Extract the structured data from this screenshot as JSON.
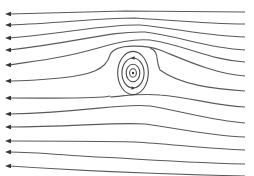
{
  "diagram": {
    "title": "Streamlines of uniform flow past a vortex",
    "colors": {
      "background": "#ffffff",
      "stroke": "#5a5a5a",
      "arrow": "#333333"
    },
    "flow_direction": "right-to-left",
    "vortex": {
      "cx": 133,
      "cy": 73,
      "rings": [
        4,
        8,
        13,
        18
      ],
      "rotation_marks": [
        "top",
        "bottom"
      ]
    },
    "streamlines": [
      {
        "id": 1,
        "d": "M245,12 C200,12 160,11 125,11 C80,12 40,13 9,14"
      },
      {
        "id": 2,
        "d": "M245,24 C205,24 170,20 135,18 C100,18 60,23 9,25"
      },
      {
        "id": 3,
        "d": "M245,37 C205,36 175,28 140,25 C105,24 70,33 9,38"
      },
      {
        "id": 4,
        "d": "M245,50 C205,48 180,36 145,32 C110,31 80,42 9,50"
      },
      {
        "id": 5,
        "d": "M245,62 C210,60 185,45 150,40 C120,38 100,50 60,57 C40,61 20,63 9,65"
      },
      {
        "id": 6,
        "d": "M245,76 C215,74 185,60 160,50 C150,46 115,42 110,55 C106,70 90,75 60,78 C40,80 20,81 9,81"
      },
      {
        "id": 7,
        "d": "M245,91 C215,89 180,85 160,70 C155,60 160,52 150,48"
      },
      {
        "id": 8,
        "d": "M110,96 C100,99 60,98 9,98"
      },
      {
        "id": 9,
        "d": "M245,107 C215,106 190,97 160,95 C140,93 125,96 110,97"
      },
      {
        "id": 10,
        "d": "M245,123 C215,121 180,111 150,106 C120,103 90,112 9,114"
      },
      {
        "id": 11,
        "d": "M245,137 C210,136 175,128 145,124 C115,122 70,127 9,127"
      },
      {
        "id": 12,
        "d": "M245,150 C210,149 170,144 135,142 C100,141 60,141 9,141"
      },
      {
        "id": 13,
        "d": "M245,164 C200,163 150,160 120,158 C80,157 40,152 9,152"
      },
      {
        "id": 14,
        "d": "M245,176 C200,175 100,172 9,166"
      }
    ],
    "arrow_heads_y": [
      14,
      25,
      38,
      50,
      65,
      81,
      98,
      114,
      127,
      141,
      152,
      166
    ]
  }
}
